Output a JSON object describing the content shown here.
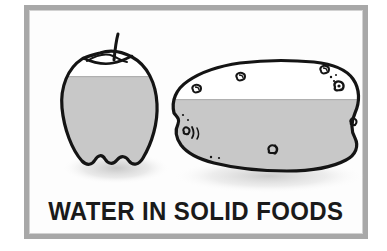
{
  "poster": {
    "caption": "WATER IN SOLID FOODS",
    "frame_color": "#a8a8a8",
    "background_color": "#ffffff",
    "board_color": "#fdfdfd",
    "outline_color": "#141414",
    "water_fill_color": "#c8c8c8",
    "dry_fill_color": "#ffffff",
    "shadow_color": "#bfbfbf",
    "items": [
      {
        "name": "apple",
        "label": "apple",
        "water_level_label": "about three quarters filled",
        "water_fraction": 0.75
      },
      {
        "name": "potato",
        "label": "potato",
        "water_level_label": "about two thirds filled",
        "water_fraction": 0.66
      }
    ]
  }
}
